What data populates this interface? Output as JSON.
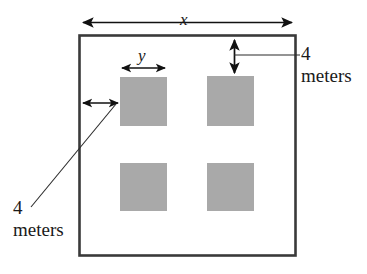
{
  "diagram": {
    "type": "geometry-figure",
    "colors": {
      "outline": "#3a3a3a",
      "square_fill": "#a9a9a9",
      "arrow": "#111111",
      "text": "#1a1a1a",
      "background": "#ffffff"
    },
    "outer_rectangle": {
      "name": "field-outline",
      "x": 79,
      "y": 35,
      "width": 216,
      "height": 220
    },
    "squares": [
      {
        "name": "plot-top-left",
        "x": 120,
        "y": 77,
        "width": 47,
        "height": 49
      },
      {
        "name": "plot-top-right",
        "x": 207,
        "y": 76,
        "width": 47,
        "height": 50
      },
      {
        "name": "plot-bottom-left",
        "x": 120,
        "y": 163,
        "width": 47,
        "height": 48
      },
      {
        "name": "plot-bottom-right",
        "x": 207,
        "y": 163,
        "width": 47,
        "height": 48
      }
    ],
    "labels": {
      "width_variable": "x",
      "square_side_variable": "y",
      "top_gap_number": "4",
      "top_gap_unit": "meters",
      "left_gap_number": "4",
      "left_gap_unit": "meters"
    },
    "dimensions": {
      "overall_width_label": "x",
      "square_side_label": "y",
      "top_margin_value": "4 meters",
      "left_margin_value": "4 meters"
    }
  }
}
